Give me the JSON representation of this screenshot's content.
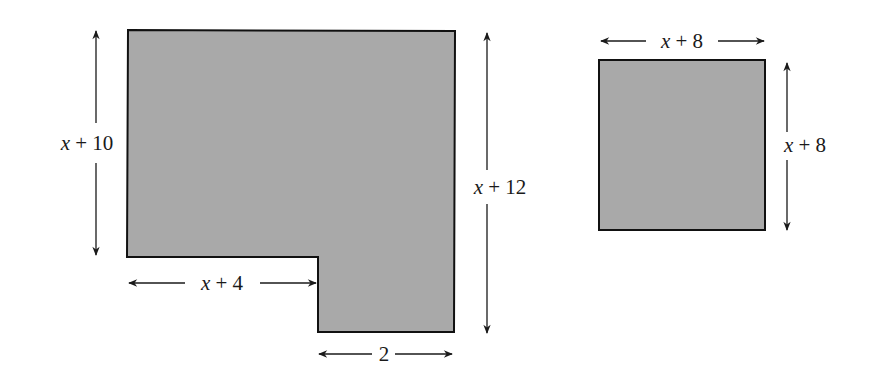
{
  "colors": {
    "fill": "#a9a9a9",
    "stroke": "#111111",
    "arrow": "#1a1a1a",
    "background": "#ffffff"
  },
  "figure_left": {
    "shape": "L-shaped polygon",
    "labels": {
      "left_height": {
        "var": "x",
        "rest": " + 10"
      },
      "right_height": {
        "var": "x",
        "rest": " + 12"
      },
      "bottom_width": {
        "var": "x",
        "rest": " + 4"
      },
      "notch_width": {
        "text": "2"
      }
    }
  },
  "figure_right": {
    "shape": "square",
    "labels": {
      "top_width": {
        "var": "x",
        "rest": " + 8"
      },
      "right_height": {
        "var": "x",
        "rest": " + 8"
      }
    }
  }
}
